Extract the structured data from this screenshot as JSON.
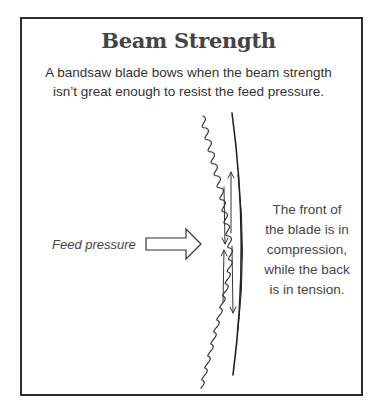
{
  "figure": {
    "title": "Beam Strength",
    "subtitle_line1": "A bandsaw blade bows when the beam strength",
    "subtitle_line2": "isn’t great enough to resist the feed pressure.",
    "feed_label": "Feed pressure",
    "note_lines": [
      "The front of",
      "the blade is in",
      "compression,",
      "while the back",
      "is in tension."
    ]
  },
  "colors": {
    "frame": "#2b2b2b",
    "ink": "#333333",
    "title": "#444444"
  }
}
